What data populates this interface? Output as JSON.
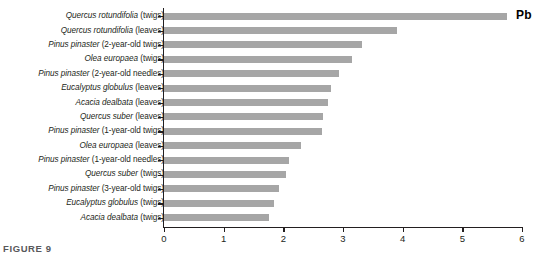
{
  "caption": "FIGURE 9",
  "series_annotation": "Pb",
  "colors": {
    "bar": "#a6a6a6",
    "axis": "#231f20",
    "caption": "#58585b"
  },
  "chart_data": {
    "type": "bar",
    "orientation": "horizontal",
    "title": "",
    "subtitle": "",
    "xlabel": "",
    "ylabel": "",
    "xlim": [
      0,
      6
    ],
    "ylim": null,
    "grid": false,
    "legend": "Pb",
    "legend_position": "top-right",
    "xticks": [
      0,
      1,
      2,
      3,
      4,
      5,
      6
    ],
    "xtick_labels": [
      "0",
      "1",
      "2",
      "3",
      "4",
      "5",
      "6"
    ],
    "series_name": "Pb",
    "categories": [
      "Quercus rotundifolia (twigs)",
      "Quercus rotundifolia (leaves)",
      "Pinus pinaster (2-year-old twigs)",
      "Olea europaea (twigs)",
      "Pinus pinaster (2-year-old needles)",
      "Eucalyptus globulus (leaves)",
      "Acacia dealbata (leaves)",
      "Quercus suber (leaves)",
      "Pinus pinaster (1-year-old twigs)",
      "Olea europaea (leaves)",
      "Pinus pinaster (1-year-old needles)",
      "Quercus suber (twigs)",
      "Pinus pinaster (3-year-old twigs)",
      "Eucalyptus globulus (twigs)",
      "Acacia dealbata (twigs)"
    ],
    "values": [
      5.75,
      3.9,
      3.32,
      3.15,
      2.93,
      2.8,
      2.75,
      2.66,
      2.65,
      2.3,
      2.1,
      2.05,
      1.93,
      1.85,
      1.76
    ],
    "rows": [
      {
        "species": "Quercus rotundifolia",
        "part": "(twigs)",
        "value": 5.75
      },
      {
        "species": "Quercus rotundifolia",
        "part": "(leaves)",
        "value": 3.9
      },
      {
        "species": "Pinus pinaster",
        "part": "(2-year-old twigs)",
        "value": 3.32
      },
      {
        "species": "Olea europaea",
        "part": "(twigs)",
        "value": 3.15
      },
      {
        "species": "Pinus pinaster",
        "part": "(2-year-old needles)",
        "value": 2.93
      },
      {
        "species": "Eucalyptus globulus",
        "part": "(leaves)",
        "value": 2.8
      },
      {
        "species": "Acacia dealbata",
        "part": "(leaves)",
        "value": 2.75
      },
      {
        "species": "Quercus suber",
        "part": "(leaves)",
        "value": 2.66
      },
      {
        "species": "Pinus pinaster",
        "part": "(1-year-old twigs)",
        "value": 2.65
      },
      {
        "species": "Olea europaea",
        "part": "(leaves)",
        "value": 2.3
      },
      {
        "species": "Pinus pinaster",
        "part": "(1-year-old needles)",
        "value": 2.1
      },
      {
        "species": "Quercus suber",
        "part": "(twigs)",
        "value": 2.05
      },
      {
        "species": "Pinus pinaster",
        "part": "(3-year-old twigs)",
        "value": 1.93
      },
      {
        "species": "Eucalyptus globulus",
        "part": "(twigs)",
        "value": 1.85
      },
      {
        "species": "Acacia dealbata",
        "part": "(twigs)",
        "value": 1.76
      }
    ]
  }
}
